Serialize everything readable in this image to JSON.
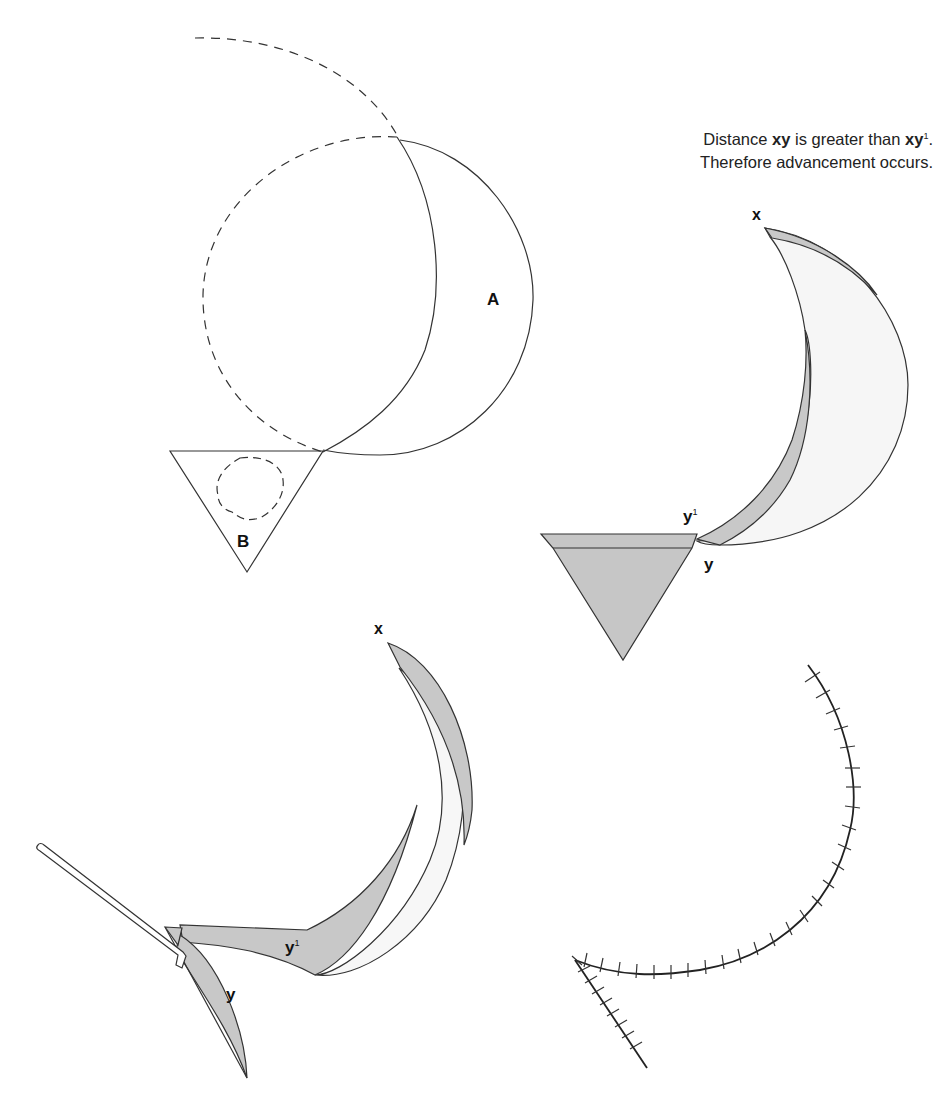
{
  "caption": {
    "line1_prefix": "Distance ",
    "line1_xy": "xy",
    "line1_mid": " is greater than ",
    "line1_xy2": "xy",
    "line1_sup": "1",
    "line1_end": ".",
    "line2": "Therefore advancement occurs."
  },
  "labels": {
    "panel1": {
      "flap": "A",
      "defect": "B"
    },
    "panel2": {
      "x": "x",
      "y1": "y",
      "y1_sup": "1",
      "y": "y"
    },
    "panel3": {
      "x": "x",
      "y1": "y",
      "y1_sup": "1",
      "y": "y"
    }
  },
  "colors": {
    "stroke": "#333333",
    "shade": "#c8c8c8",
    "light_shade": "#f4f4f4",
    "background": "#ffffff"
  }
}
